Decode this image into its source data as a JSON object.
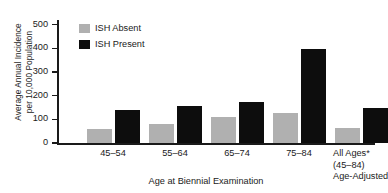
{
  "chart_data": {
    "type": "bar",
    "title": "",
    "xlabel": "Age at Biennial Examination",
    "ylabel": "Average Annual Incidence per 10,000 Population",
    "ylabel_line1": "Average Annual Incidence",
    "ylabel_line2": "per 10,000 Population",
    "categories": [
      "45–54",
      "55–64",
      "65–74",
      "75–84",
      "All Ages*"
    ],
    "category_sublabels": [
      [],
      [],
      [],
      [],
      [
        "(45–84)",
        "Age-Adjusted"
      ]
    ],
    "series": [
      {
        "name": "ISH Absent",
        "color": "#b0b0b0",
        "values": [
          60,
          80,
          110,
          130,
          65
        ]
      },
      {
        "name": "ISH Present",
        "color": "#0d0d0d",
        "values": [
          140,
          160,
          175,
          400,
          150
        ]
      }
    ],
    "ylim": [
      0,
      520
    ],
    "ytick_values": [
      0,
      100,
      200,
      300,
      400,
      500
    ],
    "ytick_labels": [
      "0",
      "100",
      "200",
      "300",
      "400",
      "500"
    ],
    "grid": false,
    "legend_position": "top-left-inside"
  },
  "legend": {
    "entries": [
      {
        "label": "ISH Absent",
        "color": "#b0b0b0"
      },
      {
        "label": "ISH Present",
        "color": "#0d0d0d"
      }
    ]
  }
}
